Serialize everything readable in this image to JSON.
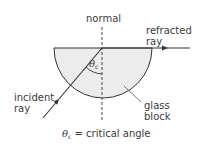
{
  "labels": {
    "normal": "normal",
    "refracted_line1": "refracted",
    "refracted_line2": "ray",
    "incident_line1": "incident",
    "incident_line2": "ray",
    "glass_line1": "glass",
    "glass_line2": "block",
    "angle_symbol": "θ",
    "angle_subscript": "c"
  },
  "caption": {
    "symbol": "θ",
    "subscript": "c",
    "text": " = critical angle"
  },
  "colors": {
    "block_fill": "#ececec",
    "stroke": "#333333",
    "text": "#3a3a3a"
  }
}
